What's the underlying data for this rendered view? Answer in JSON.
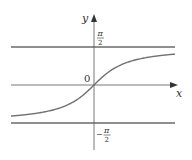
{
  "diagram": {
    "function": "y = arctan(x)",
    "axes": {
      "x_label": "x",
      "y_label": "y",
      "origin_label": "0"
    },
    "asymptotes": [
      {
        "name": "upper",
        "value_label_num": "π",
        "value_label_den": "2",
        "sign": ""
      },
      {
        "name": "lower",
        "value_label_num": "π",
        "value_label_den": "2",
        "sign": "−"
      }
    ],
    "colors": {
      "axis": "#555555",
      "curve": "#707070",
      "asymptote": "#6a6a6a"
    }
  }
}
